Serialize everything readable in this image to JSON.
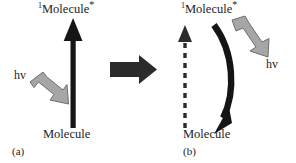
{
  "figure": {
    "type": "scientific-diagram",
    "background_color": "#ffffff",
    "width": 296,
    "height": 163
  },
  "colors": {
    "black_arrow": "#151515",
    "gray_arrow_fill": "#a6a6a6",
    "gray_arrow_stroke": "#6e6e6e",
    "transition_arrow": "#2b2b2b",
    "text": "#1c1c1c"
  },
  "panel_a": {
    "caption": "(a)",
    "excited_state_prefix": "1",
    "excited_state_name": "Molecule",
    "excited_state_suffix": "*",
    "ground_state_label": "Molecule",
    "photon_label": "hv",
    "vertical_arrow": {
      "name": "absorption-arrow",
      "style": "solid",
      "direction": "up",
      "color": "#151515"
    },
    "photon_arrow": {
      "name": "incoming-photon-arrow",
      "style": "block",
      "direction": "down-right",
      "color": "#a6a6a6"
    }
  },
  "transition": {
    "arrow_label": "",
    "name": "transition-arrow",
    "direction": "right",
    "color": "#2b2b2b"
  },
  "panel_b": {
    "caption": "(b)",
    "excited_state_prefix": "1",
    "excited_state_name": "Molecule",
    "excited_state_suffix": "*",
    "ground_state_label": "Molecule",
    "photon_label": "hv",
    "vertical_arrow": {
      "name": "dashed-absorption-arrow",
      "style": "dashed",
      "direction": "up",
      "color": "#2b2b2b"
    },
    "curved_arrow": {
      "name": "emission-curved-arrow",
      "style": "solid-curved",
      "direction": "down",
      "color": "#151515"
    },
    "photon_arrow": {
      "name": "outgoing-photon-arrow",
      "style": "block",
      "direction": "down-right",
      "color": "#a6a6a6"
    }
  }
}
